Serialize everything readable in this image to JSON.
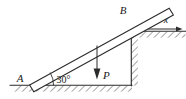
{
  "figure": {
    "background_color": "#ffffff",
    "line_color": "#2b2b2b",
    "width": 186,
    "height": 99
  },
  "labels": {
    "point_a": "A",
    "point_b": "B",
    "force": "P",
    "axis_x": "x",
    "angle": "30°"
  },
  "geometry": {
    "angle_degrees": 30,
    "bar": {
      "lower_end_x": 30,
      "lower_end_y": 83,
      "upper_end_x": 172,
      "upper_end_y": 11,
      "thickness": 5
    },
    "force_arrow": {
      "origin_x": 97,
      "origin_y": 48,
      "tip_x": 97,
      "tip_y": 79,
      "direction": "down"
    },
    "ground": {
      "y": 85,
      "x_start": 0,
      "x_end": 131
    },
    "step_corner": {
      "corner_x": 131,
      "ledge_y": 31,
      "ledge_x_end": 186
    },
    "axis_x": {
      "start_x": 133,
      "end_x": 180,
      "y": 29,
      "direction": "right"
    }
  }
}
